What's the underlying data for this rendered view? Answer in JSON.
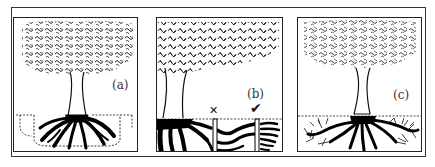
{
  "figure": {
    "panels": [
      {
        "id": "a",
        "label": "(a)",
        "description": "Tree with roots enclosed by a dashed U-shaped root barrier below ground line"
      },
      {
        "id": "b",
        "label": "(b)",
        "description": "Tree beside vertical barriers; roots pass under the shallow barrier and are stopped by the deep barrier",
        "marks": {
          "wrong": "✕",
          "right": "✔"
        }
      },
      {
        "id": "c",
        "label": "(c)",
        "description": "Tree with roots spreading freely beneath dashed ground line"
      }
    ]
  }
}
